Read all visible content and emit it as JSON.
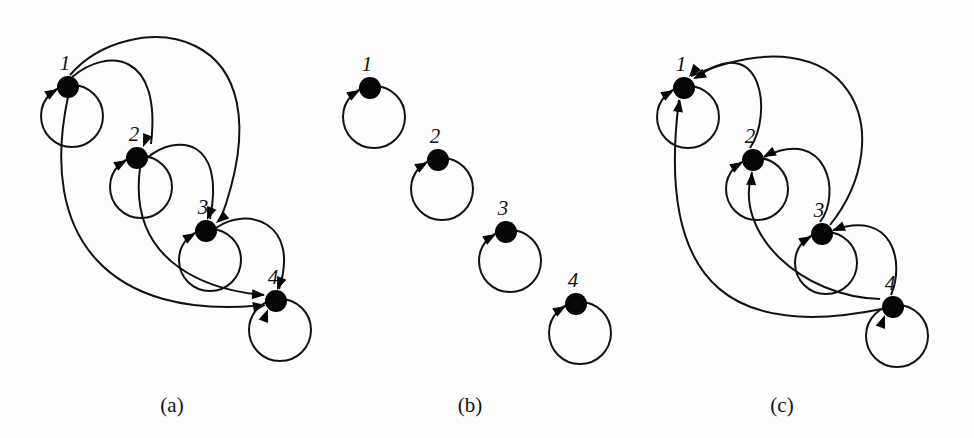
{
  "figure": {
    "panels": [
      {
        "id": "a",
        "label": "(a)",
        "nodes": [
          "1",
          "2",
          "3",
          "4"
        ],
        "self_loops": [
          "1",
          "2",
          "3",
          "4"
        ],
        "edges": [
          {
            "from": "1",
            "to": "2"
          },
          {
            "from": "1",
            "to": "3"
          },
          {
            "from": "1",
            "to": "4"
          },
          {
            "from": "2",
            "to": "3"
          },
          {
            "from": "2",
            "to": "4"
          },
          {
            "from": "3",
            "to": "4"
          }
        ]
      },
      {
        "id": "b",
        "label": "(b)",
        "nodes": [
          "1",
          "2",
          "3",
          "4"
        ],
        "self_loops": [
          "1",
          "2",
          "3",
          "4"
        ],
        "edges": []
      },
      {
        "id": "c",
        "label": "(c)",
        "nodes": [
          "1",
          "2",
          "3",
          "4"
        ],
        "self_loops": [
          "1",
          "2",
          "3",
          "4"
        ],
        "edges": [
          {
            "from": "2",
            "to": "1"
          },
          {
            "from": "3",
            "to": "1"
          },
          {
            "from": "4",
            "to": "1"
          },
          {
            "from": "3",
            "to": "2"
          },
          {
            "from": "4",
            "to": "2"
          },
          {
            "from": "4",
            "to": "3"
          }
        ]
      }
    ]
  }
}
